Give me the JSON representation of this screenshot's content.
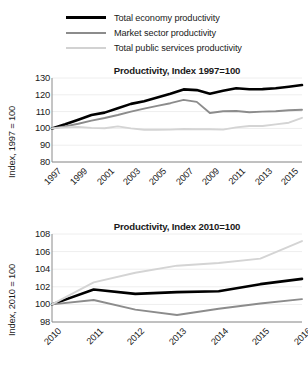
{
  "legend": {
    "items": [
      {
        "label": "Total economy productivity",
        "key": "total",
        "color": "#000000"
      },
      {
        "label": "Market sector productivity",
        "key": "market",
        "color": "#8c8c8c"
      },
      {
        "label": "Total public services productivity",
        "key": "public",
        "color": "#d2d2d2"
      }
    ]
  },
  "chart_data": [
    {
      "type": "line",
      "title": "Productivity, Index 1997=100",
      "xlabel": "",
      "ylabel": "Index, 1997 = 100",
      "ylim": [
        80,
        130
      ],
      "yticks": [
        130,
        120,
        110,
        100,
        90,
        80
      ],
      "grid": true,
      "legend_position": "top",
      "x": [
        1997,
        1998,
        1999,
        2000,
        2001,
        2002,
        2003,
        2004,
        2005,
        2006,
        2007,
        2008,
        2009,
        2010,
        2011,
        2012,
        2013,
        2014,
        2015,
        2016
      ],
      "xtick_labels": [
        "1997",
        "1999",
        "2001",
        "2003",
        "2005",
        "2007",
        "2009",
        "2011",
        "2013",
        "2015"
      ],
      "xticks": [
        1997,
        1999,
        2001,
        2003,
        2005,
        2007,
        2009,
        2011,
        2013,
        2015
      ],
      "series": [
        {
          "name": "Total economy productivity",
          "color": "#000000",
          "values": [
            100.0,
            102.5,
            105.2,
            108.0,
            109.4,
            112.0,
            114.6,
            116.2,
            118.4,
            120.6,
            123.2,
            122.8,
            120.6,
            122.4,
            123.9,
            123.3,
            123.4,
            123.9,
            124.8,
            125.8
          ]
        },
        {
          "name": "Market sector productivity",
          "color": "#8c8c8c",
          "values": [
            100.0,
            101.2,
            102.8,
            104.6,
            106.2,
            108.0,
            110.0,
            111.8,
            113.4,
            115.0,
            117.0,
            115.8,
            109.2,
            110.2,
            110.4,
            109.6,
            110.0,
            110.2,
            110.8,
            111.1
          ]
        },
        {
          "name": "Total public services productivity",
          "color": "#d4d4d4",
          "values": [
            100.0,
            100.6,
            100.9,
            100.3,
            100.1,
            101.2,
            100.0,
            99.2,
            99.2,
            99.3,
            99.6,
            99.5,
            99.5,
            99.3,
            100.6,
            101.4,
            101.4,
            102.4,
            103.4,
            106.3
          ]
        }
      ]
    },
    {
      "type": "line",
      "title": "Productivity, Index 2010=100",
      "xlabel": "",
      "ylabel": "Index, 2010 = 100",
      "ylim": [
        98,
        108
      ],
      "yticks": [
        108,
        106,
        104,
        102,
        100,
        98
      ],
      "grid": true,
      "legend_position": "top",
      "x": [
        2010,
        2011,
        2012,
        2013,
        2014,
        2015,
        2016
      ],
      "xtick_labels": [
        "2010",
        "2011",
        "2012",
        "2013",
        "2014",
        "2015",
        "2016"
      ],
      "xticks": [
        2010,
        2011,
        2012,
        2013,
        2014,
        2015,
        2016
      ],
      "series": [
        {
          "name": "Total economy productivity",
          "color": "#000000",
          "values": [
            100.0,
            101.7,
            101.2,
            101.4,
            101.5,
            102.3,
            102.9
          ]
        },
        {
          "name": "Market sector productivity",
          "color": "#8c8c8c",
          "values": [
            100.0,
            100.5,
            99.4,
            98.8,
            99.5,
            100.1,
            100.6
          ]
        },
        {
          "name": "Total public services productivity",
          "color": "#d4d4d4",
          "values": [
            100.0,
            102.5,
            103.6,
            104.4,
            104.7,
            105.2,
            107.2
          ]
        }
      ]
    }
  ]
}
